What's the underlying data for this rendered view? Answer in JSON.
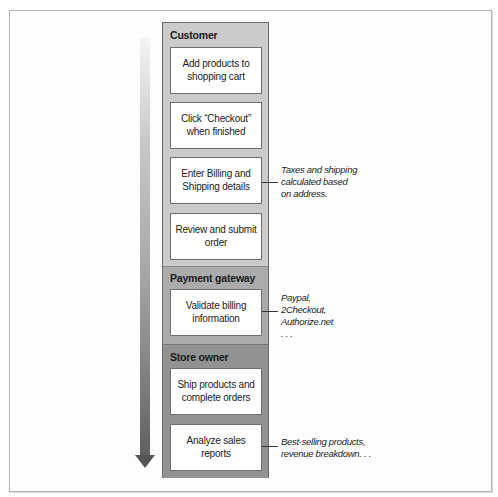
{
  "diagram": {
    "type": "swimlane-process-flow",
    "flow_direction": "top-to-bottom",
    "sections": [
      {
        "title": "Customer",
        "color": "#cbcbcb",
        "steps": [
          {
            "label": "Add products to shopping cart"
          },
          {
            "label": "Click “Checkout” when finished"
          },
          {
            "label": "Enter Billing and Shipping details"
          },
          {
            "label": "Review and submit order"
          }
        ]
      },
      {
        "title": "Payment gateway",
        "color": "#ababab",
        "steps": [
          {
            "label": "Validate billing information"
          }
        ]
      },
      {
        "title": "Store owner",
        "color": "#929292",
        "steps": [
          {
            "label": "Ship products and complete orders"
          },
          {
            "label": "Analyze sales reports"
          }
        ]
      }
    ],
    "annotations": [
      {
        "attached_to": "Enter Billing and Shipping details",
        "lines": [
          "Taxes and shipping",
          "calculated based",
          "on address."
        ]
      },
      {
        "attached_to": "Validate billing information",
        "lines": [
          "Paypal,",
          "2Checkout,",
          "Authorize.net",
          ". . ."
        ]
      },
      {
        "attached_to": "Analyze sales reports",
        "lines": [
          "Best-selling products,",
          "revenue breakdown. . ."
        ]
      }
    ]
  }
}
